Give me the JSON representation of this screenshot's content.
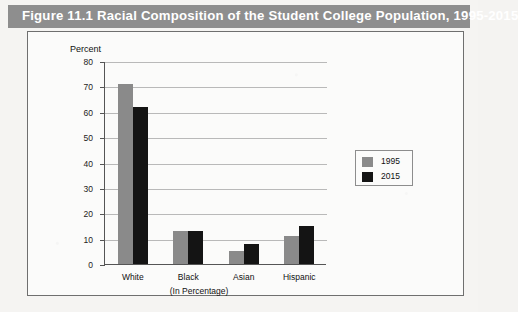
{
  "figure": {
    "title": "Figure 11.1  Racial Composition of the Student College Population, 1995-2015",
    "banner_color": "#8e8e8e",
    "title_color": "#ffffff"
  },
  "chart_data": {
    "type": "bar",
    "title": "Figure 11.1  Racial Composition of the Student College Population, 1995-2015",
    "categories": [
      "White",
      "Black",
      "Asian",
      "Hispanic"
    ],
    "series": [
      {
        "name": "1995",
        "color": "#8a8a8a",
        "values": [
          71,
          13,
          5,
          11
        ]
      },
      {
        "name": "2015",
        "color": "#141414",
        "values": [
          62,
          13,
          8,
          15
        ]
      }
    ],
    "xlabel": "(In Percentage)",
    "ylabel": "Percent",
    "ylim": [
      0,
      80
    ],
    "ytick_step": 10,
    "yticks": [
      "80",
      "70",
      "60",
      "50",
      "40",
      "30",
      "20",
      "10",
      "0"
    ],
    "grid": true,
    "legend_position": "right"
  },
  "legend": {
    "items": [
      {
        "label": "1995",
        "color": "#8a8a8a"
      },
      {
        "label": "2015",
        "color": "#141414"
      }
    ]
  }
}
